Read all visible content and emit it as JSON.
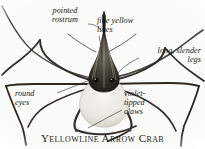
{
  "figure": {
    "kind": "annotated-natural-history-illustration",
    "subject": "Yellowline Arrow Crab",
    "caption": "Yellowline Arrow Crab",
    "background_color": "#fbfbf9",
    "ink_color": "#16140f",
    "width_px": 205,
    "height_px": 149
  },
  "callouts": [
    {
      "id": "pointed-rostrum",
      "text": "pointed\nrostrum",
      "position": "top-left",
      "points_to": "rostrum"
    },
    {
      "id": "fine-yellow-lines",
      "text": "fine yellow\nlines",
      "position": "top-right",
      "points_to": "carapace"
    },
    {
      "id": "long-slender-legs",
      "text": "long, slender\nlegs",
      "position": "right",
      "points_to": "walking-leg"
    },
    {
      "id": "round-eyes",
      "text": "round\neyes",
      "position": "bottom-left",
      "points_to": "eye"
    },
    {
      "id": "violet-tipped-claws",
      "text": "violet-\ntipped\nclaws",
      "position": "bottom-right",
      "points_to": "claw"
    }
  ]
}
